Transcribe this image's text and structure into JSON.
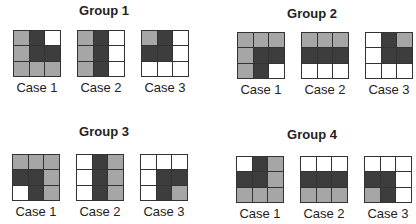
{
  "colors": {
    "gray": "#a6a6a6",
    "dark": "#3d3d3d",
    "white": "#ffffff",
    "border": "#333333"
  },
  "legend": {
    "g": "gray",
    "d": "dark",
    "w": "white"
  },
  "groups": [
    {
      "title": "Group 1",
      "cases": [
        {
          "label": "Case 1",
          "cells": [
            "g",
            "d",
            "w",
            "g",
            "d",
            "d",
            "g",
            "g",
            "g"
          ]
        },
        {
          "label": "Case 2",
          "cells": [
            "g",
            "d",
            "w",
            "g",
            "d",
            "w",
            "g",
            "d",
            "w"
          ]
        },
        {
          "label": "Case 3",
          "cells": [
            "g",
            "d",
            "w",
            "d",
            "d",
            "w",
            "w",
            "w",
            "w"
          ]
        }
      ]
    },
    {
      "title": "Group 2",
      "cases": [
        {
          "label": "Case 1",
          "cells": [
            "g",
            "g",
            "g",
            "g",
            "d",
            "d",
            "g",
            "d",
            "w"
          ]
        },
        {
          "label": "Case 2",
          "cells": [
            "g",
            "g",
            "g",
            "d",
            "d",
            "d",
            "w",
            "w",
            "w"
          ]
        },
        {
          "label": "Case 3",
          "cells": [
            "w",
            "d",
            "g",
            "w",
            "d",
            "d",
            "w",
            "w",
            "w"
          ]
        }
      ]
    },
    {
      "title": "Group 3",
      "cases": [
        {
          "label": "Case 1",
          "cells": [
            "g",
            "g",
            "g",
            "d",
            "d",
            "g",
            "w",
            "d",
            "g"
          ]
        },
        {
          "label": "Case 2",
          "cells": [
            "w",
            "d",
            "g",
            "w",
            "d",
            "g",
            "w",
            "d",
            "g"
          ]
        },
        {
          "label": "Case 3",
          "cells": [
            "w",
            "w",
            "w",
            "w",
            "d",
            "d",
            "w",
            "d",
            "g"
          ]
        }
      ]
    },
    {
      "title": "Group 4",
      "cases": [
        {
          "label": "Case 1",
          "cells": [
            "w",
            "d",
            "g",
            "d",
            "d",
            "g",
            "g",
            "g",
            "g"
          ]
        },
        {
          "label": "Case 2",
          "cells": [
            "w",
            "w",
            "w",
            "d",
            "d",
            "d",
            "g",
            "g",
            "g"
          ]
        },
        {
          "label": "Case 3",
          "cells": [
            "w",
            "w",
            "w",
            "d",
            "d",
            "w",
            "g",
            "d",
            "w"
          ]
        }
      ]
    }
  ]
}
